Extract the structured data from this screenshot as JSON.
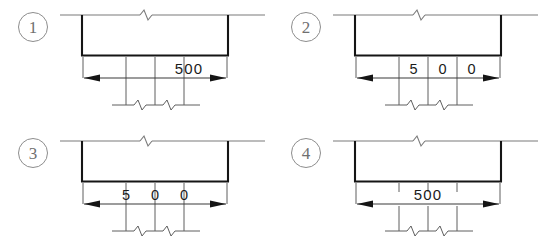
{
  "drawing": {
    "title": "Dimension annotation options for beam section",
    "stroke_thin": "#6f6f6f",
    "stroke_medium": "#3a3a3a",
    "stroke_heavy": "#111111",
    "text_color": "#1b1b1b",
    "marker_color": "#6f6f6f"
  },
  "options": [
    {
      "marker": "1",
      "name": "option-1",
      "dimension_text": "500",
      "dimension_value": 500,
      "text_style": "single-block-offset-right",
      "text_above_line": true,
      "digits": [
        "5",
        "0",
        "0"
      ],
      "break_symbols_top": 1,
      "break_symbols_bottom": 2,
      "extension_lines": 3
    },
    {
      "marker": "2",
      "name": "option-2",
      "dimension_text": "5 0 0",
      "dimension_value": 500,
      "text_style": "digits-between-extension-lines",
      "text_above_line": true,
      "digits": [
        "5",
        "0",
        "0"
      ],
      "break_symbols_top": 1,
      "break_symbols_bottom": 2,
      "extension_lines": 3
    },
    {
      "marker": "3",
      "name": "option-3",
      "dimension_text": "5 0 0",
      "dimension_value": 500,
      "text_style": "digits-centered-on-extension-lines",
      "text_above_line": true,
      "digits": [
        "5",
        "0",
        "0"
      ],
      "break_symbols_top": 1,
      "break_symbols_bottom": 2,
      "extension_lines": 3
    },
    {
      "marker": "4",
      "name": "option-4",
      "dimension_text": "500",
      "dimension_value": 500,
      "text_style": "single-block-centered-on-line",
      "text_above_line": false,
      "digits": [
        "5",
        "0",
        "0"
      ],
      "break_symbols_top": 1,
      "break_symbols_bottom": 2,
      "extension_lines": 3
    }
  ]
}
